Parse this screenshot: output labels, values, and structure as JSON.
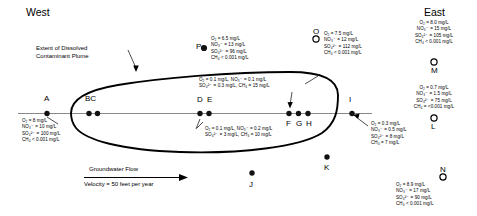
{
  "compass": {
    "west": "West",
    "east": "East"
  },
  "plume_annotation": {
    "line1": "Extent of Dissolved",
    "line2": "Contaminant Plume"
  },
  "flow": {
    "title": "Groundwater Flow",
    "velocity": "Velocity = 50 feet per year"
  },
  "units": "mg/L",
  "well_labels": {
    "a": "A",
    "bc": "BC",
    "d": "D",
    "e": "E",
    "f": "F",
    "g": "G",
    "h": "H",
    "i": "I",
    "j": "J",
    "k": "K",
    "l": "L",
    "m": "M",
    "n": "N",
    "o": "O",
    "p": "P"
  },
  "chem_blocks": {
    "a": {
      "o2": "O₂ = 8 mg/L",
      "no3": "NO₃⁻ = 10 mg/L",
      "so4": "SO₄²⁻ = 100 mg/L",
      "ch4": "CH₄ < 0.001 mg/L"
    },
    "p": {
      "o2": "O₂ = 6.5 mg/L",
      "no3": "NO₃⁻ = 13 mg/L",
      "so4": "SO₄²⁻ = 96 mg/L",
      "ch4": "CH₄ < 0.001 mg/L"
    },
    "o_upper": {
      "o2": "O₂ = 7.5 mg/L",
      "no3": "NO₃⁻ = 12 mg/L",
      "so4": "SO₄²⁻ = 112 mg/L",
      "ch4": "CH₄ < 0.001 mg/L"
    },
    "m": {
      "o2": "O₂ = 8.0 mg/L",
      "no3": "NO₃⁻ = 15 mg/L",
      "so4": "SO₄²⁻ = 105 mg/L",
      "ch4": "CH₄ < 0.001 mg/L"
    },
    "l": {
      "o2": "O₂ = 0.7 mg/L",
      "no3": "NO₃⁻ = 1.5 mg/L",
      "so4": "SO₄²⁻ = 75 mg/L",
      "ch4": "CH₄ = <0.001 mg/L"
    },
    "n": {
      "o2": "O₂ = 8.9 mg/L",
      "no3": "NO₃⁻ = 17 mg/L",
      "so4": "SO₄²⁻ = 90 mg/L",
      "ch4": "CH₄ < 0.001 mg/L"
    },
    "plume_upper": {
      "line1": "O₂ = 0.1 mg/L, NO₃⁻ = 0.1 mg/L",
      "line2": "SO₄²⁻ = 0.3 mg/L, CH₄ = 15 mg/L"
    },
    "plume_lower": {
      "line1": "O₂ = 0.1 mg/L, NO₃⁻ = 0.2 mg/L",
      "line2": "SO₄²⁻ = 3 mg/L, CH₄ = 10 mg/L"
    },
    "i": {
      "o2": "O₂ = 0.3 mg/L",
      "no3": "NO₃⁻ = 0.5 mg/L",
      "so4": "SO₄²⁻ = 8 mg/L",
      "ch4": "CH₄ = 7 mg/L"
    }
  }
}
